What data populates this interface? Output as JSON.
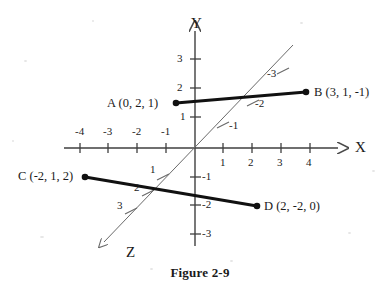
{
  "figure": {
    "caption": "Figure 2-9",
    "caption_pos": {
      "x": 200,
      "y": 266
    }
  },
  "axes": {
    "origin": {
      "x": 195,
      "y": 148
    },
    "x_axis": {
      "name": "X",
      "name_pos": {
        "x": 355,
        "y": 140
      },
      "line": {
        "x1": 64,
        "y1": 148,
        "x2": 338,
        "y2": 148
      },
      "arrow": true,
      "unit_px": 28.6,
      "ticks": [
        {
          "value": "-4",
          "x": 80,
          "label_x": 75,
          "label_y": 126
        },
        {
          "value": "-3",
          "x": 108,
          "label_x": 103,
          "label_y": 126
        },
        {
          "value": "-2",
          "x": 137,
          "label_x": 132,
          "label_y": 126
        },
        {
          "value": "-1",
          "x": 166,
          "label_x": 161,
          "label_y": 126
        },
        {
          "value": "1",
          "x": 223,
          "label_x": 220,
          "label_y": 157
        },
        {
          "value": "2",
          "x": 252,
          "label_x": 248,
          "label_y": 157
        },
        {
          "value": "3",
          "x": 281,
          "label_x": 277,
          "label_y": 157
        },
        {
          "value": "4",
          "x": 310,
          "label_x": 306,
          "label_y": 157
        }
      ]
    },
    "y_axis": {
      "name": "Y",
      "name_pos": {
        "x": 191,
        "y": 16
      },
      "line": {
        "x1": 195,
        "y1": 31,
        "x2": 195,
        "y2": 246
      },
      "arrow": true,
      "unit_px": 28.6,
      "ticks": [
        {
          "value": "3",
          "y": 59,
          "label_x": 177,
          "label_y": 53
        },
        {
          "value": "2",
          "y": 88,
          "label_x": 177,
          "label_y": 82
        },
        {
          "value": "1",
          "y": 117,
          "label_x": 180,
          "label_y": 111
        },
        {
          "value": "-1",
          "y": 177,
          "label_x": 202,
          "label_y": 171
        },
        {
          "value": "-2",
          "y": 205,
          "label_x": 202,
          "label_y": 199
        },
        {
          "value": "-3",
          "y": 234,
          "label_x": 202,
          "label_y": 228
        }
      ]
    },
    "z_axis": {
      "name": "Z",
      "name_pos": {
        "x": 126,
        "y": 245
      },
      "line": {
        "x1": 293,
        "y1": 45,
        "x2": 104,
        "y2": 242
      },
      "arrow": true,
      "ticks": [
        {
          "value": "1",
          "x": 163,
          "y": 177,
          "label_x": 150,
          "label_y": 164
        },
        {
          "value": "2",
          "x": 148,
          "y": 193,
          "label_x": 134,
          "label_y": 182
        },
        {
          "value": "3",
          "x": 131,
          "y": 211,
          "label_x": 117,
          "label_y": 200
        },
        {
          "value": "-1",
          "x": 223,
          "y": 125,
          "label_x": 229,
          "label_y": 120
        },
        {
          "value": "-2",
          "x": 253,
          "y": 103,
          "label_x": 255,
          "label_y": 98
        },
        {
          "value": "-3",
          "x": 283,
          "y": 71,
          "label_x": 267,
          "label_y": 68
        }
      ]
    }
  },
  "points": [
    {
      "id": "A",
      "label": "A (0, 2, 1)",
      "dot": {
        "x": 176,
        "y": 103
      },
      "label_pos": {
        "x": 107,
        "y": 97
      },
      "label_align": "left"
    },
    {
      "id": "B",
      "label": "B (3, 1, -1)",
      "dot": {
        "x": 306,
        "y": 92
      },
      "label_pos": {
        "x": 314,
        "y": 86
      },
      "label_align": "left"
    },
    {
      "id": "C",
      "label": "C (-2, 1, 2)",
      "dot": {
        "x": 85,
        "y": 177
      },
      "label_pos": {
        "x": 18,
        "y": 170
      },
      "label_align": "left"
    },
    {
      "id": "D",
      "label": "D (2, -2, 0)",
      "dot": {
        "x": 257,
        "y": 206
      },
      "label_pos": {
        "x": 264,
        "y": 200
      },
      "label_align": "left"
    }
  ],
  "segments": [
    {
      "id": "AB",
      "from": "A",
      "to": "B",
      "x1": 176,
      "y1": 103,
      "x2": 306,
      "y2": 92
    },
    {
      "id": "CD",
      "from": "C",
      "to": "D",
      "x1": 85,
      "y1": 177,
      "x2": 257,
      "y2": 206
    }
  ],
  "colors": {
    "ink": "#1a1a1a",
    "axis": "#4a4a4a",
    "segment": "#111111",
    "background": "#ffffff",
    "speck": "#cfcfcf"
  },
  "chart_data": {
    "type": "scatter",
    "title": "Figure 2-9",
    "xlabel": "X",
    "ylabel": "Y",
    "zlabel": "Z",
    "xlim": [
      -4,
      4
    ],
    "ylim": [
      -3,
      3
    ],
    "zlim": [
      -3,
      3
    ],
    "grid": false,
    "legend": "none",
    "points": [
      {
        "name": "A",
        "x": 0,
        "y": 2,
        "z": 1
      },
      {
        "name": "B",
        "x": 3,
        "y": 1,
        "z": -1
      },
      {
        "name": "C",
        "x": -2,
        "y": 1,
        "z": 2
      },
      {
        "name": "D",
        "x": 2,
        "y": -2,
        "z": 0
      }
    ],
    "segments": [
      {
        "from": "A",
        "to": "B"
      },
      {
        "from": "C",
        "to": "D"
      }
    ],
    "x_ticks": [
      -4,
      -3,
      -2,
      -1,
      1,
      2,
      3,
      4
    ],
    "y_ticks": [
      3,
      2,
      1,
      -1,
      -2,
      -3
    ],
    "z_ticks": [
      1,
      2,
      3,
      -1,
      -2,
      -3
    ]
  }
}
